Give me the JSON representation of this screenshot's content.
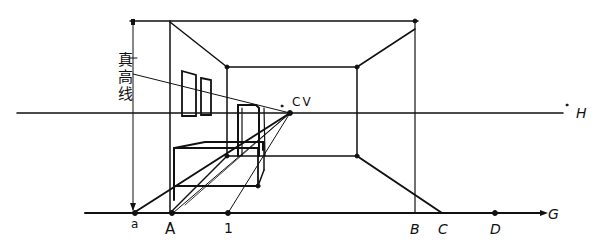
{
  "diagram": {
    "ink_color": "#111111",
    "background": "#ffffff",
    "labels": {
      "vanishing_point": "CV",
      "horizon_line": "H",
      "ground_line": "G",
      "height_line": "真高线",
      "ground_points": {
        "a": "a",
        "A": "A",
        "one": "1",
        "B": "B",
        "C": "C",
        "D": "D"
      }
    }
  }
}
